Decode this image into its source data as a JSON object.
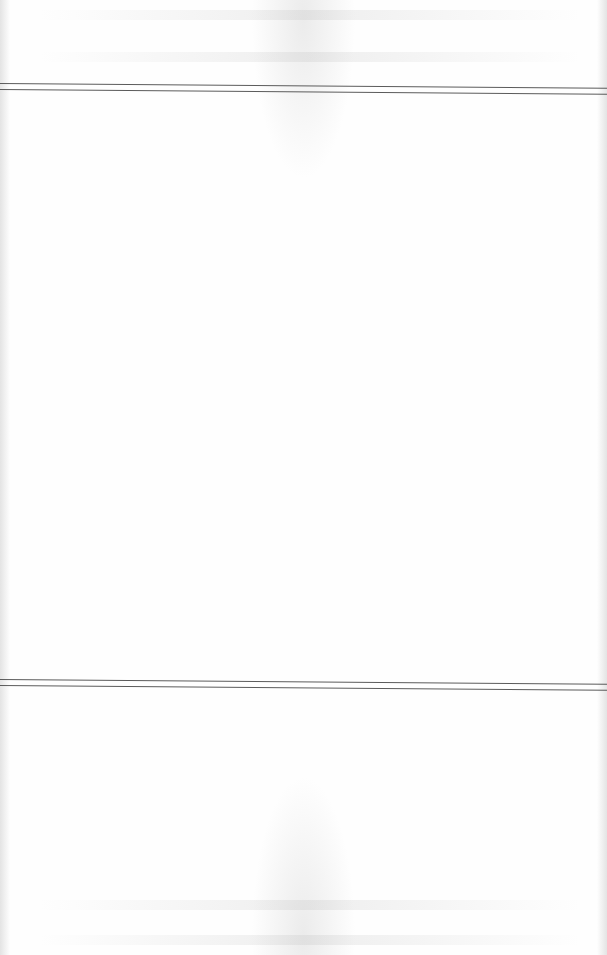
{
  "document": {
    "type": "scanned-page",
    "background_color": "#fefefe",
    "rule_color": "#5a5a5a",
    "text_content": "",
    "rules": [
      {
        "position": "upper",
        "style": "double"
      },
      {
        "position": "lower",
        "style": "double"
      }
    ]
  }
}
